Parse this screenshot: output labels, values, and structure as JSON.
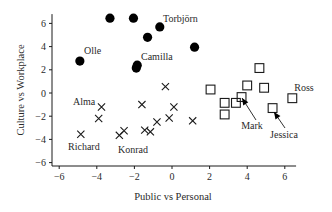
{
  "chart_data": {
    "type": "scatter",
    "title": "",
    "xlabel": "Public vs Personal",
    "ylabel": "Culture vs Workplace",
    "xlim": [
      -6.5,
      6.6
    ],
    "ylim": [
      -6.3,
      6.8
    ],
    "xticks": [
      -6,
      -4,
      -2,
      0,
      2,
      4,
      6
    ],
    "yticks": [
      -6,
      -4,
      -2,
      0,
      2,
      4,
      6
    ],
    "grid": false,
    "legend": null,
    "series": [
      {
        "name": "filled-circles",
        "marker": "circle",
        "points": [
          {
            "x": -3.3,
            "y": 6.45
          },
          {
            "x": -2.05,
            "y": 6.45
          },
          {
            "x": -0.65,
            "y": 5.7
          },
          {
            "x": -1.3,
            "y": 4.8
          },
          {
            "x": 1.2,
            "y": 3.95
          },
          {
            "x": -4.9,
            "y": 2.75
          },
          {
            "x": -1.85,
            "y": 2.4
          },
          {
            "x": -1.9,
            "y": 2.15
          }
        ]
      },
      {
        "name": "crosses",
        "marker": "x",
        "points": [
          {
            "x": -0.35,
            "y": 0.55
          },
          {
            "x": -3.75,
            "y": -1.2
          },
          {
            "x": -1.6,
            "y": -1.0
          },
          {
            "x": 0.1,
            "y": -1.2
          },
          {
            "x": -3.9,
            "y": -2.2
          },
          {
            "x": -0.15,
            "y": -2.15
          },
          {
            "x": -0.8,
            "y": -2.5
          },
          {
            "x": 1.1,
            "y": -2.4
          },
          {
            "x": -4.85,
            "y": -3.55
          },
          {
            "x": -2.55,
            "y": -3.25
          },
          {
            "x": -2.8,
            "y": -3.65
          },
          {
            "x": -1.45,
            "y": -3.2
          },
          {
            "x": -1.15,
            "y": -3.35
          }
        ]
      },
      {
        "name": "open-squares",
        "marker": "square",
        "points": [
          {
            "x": 4.65,
            "y": 2.15
          },
          {
            "x": 2.05,
            "y": 0.3
          },
          {
            "x": 4.0,
            "y": 0.65
          },
          {
            "x": 4.9,
            "y": 0.45
          },
          {
            "x": 6.4,
            "y": -0.45
          },
          {
            "x": 2.8,
            "y": -0.85
          },
          {
            "x": 3.4,
            "y": -0.85
          },
          {
            "x": 3.7,
            "y": -0.35
          },
          {
            "x": 2.8,
            "y": -1.85
          },
          {
            "x": 5.35,
            "y": -1.3
          }
        ]
      }
    ],
    "annotations": [
      {
        "text": "Olle",
        "px": 84,
        "py": 54,
        "anchor": "start"
      },
      {
        "text": "Camilla",
        "px": 141,
        "py": 60,
        "anchor": "start"
      },
      {
        "text": "Torbjörn",
        "px": 163,
        "py": 22,
        "anchor": "start"
      },
      {
        "text": "Alma",
        "px": 73,
        "py": 105,
        "anchor": "start"
      },
      {
        "text": "Richard",
        "px": 68,
        "py": 150,
        "anchor": "start"
      },
      {
        "text": "Konrad",
        "px": 118,
        "py": 153,
        "anchor": "start"
      },
      {
        "text": "Ross",
        "px": 304,
        "py": 91,
        "anchor": "middle"
      },
      {
        "text": "Mark",
        "px": 252,
        "py": 129,
        "anchor": "middle",
        "arrow": {
          "from": [
            256,
            120
          ],
          "to": [
            242,
            98
          ]
        }
      },
      {
        "text": "Jessica",
        "px": 284,
        "py": 138,
        "anchor": "middle",
        "arrow": {
          "from": [
            285,
            128
          ],
          "to": [
            274,
            112
          ]
        }
      }
    ]
  }
}
